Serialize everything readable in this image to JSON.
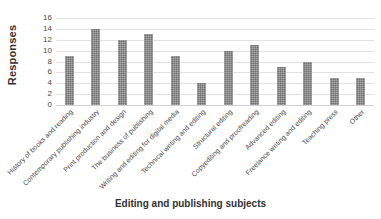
{
  "chart_data": {
    "type": "bar",
    "title": "",
    "xlabel": "Editing and publishing subjects",
    "ylabel": "Responses",
    "ylim": [
      0,
      16
    ],
    "ytick_step": 2,
    "yticks": [
      16,
      14,
      12,
      10,
      8,
      6,
      4,
      2,
      0
    ],
    "grid": true,
    "legend": false,
    "bar_color": "#707070",
    "categories": [
      "History of books and reading",
      "Contemporary publishing industry",
      "Print production and design",
      "The business of publishing",
      "Writing and editing for digital media",
      "Technical writing and editing",
      "Structural editing",
      "Copyediting and proofreading",
      "Advanced editing",
      "Freelance writing and editing",
      "Teaching press",
      "Other"
    ],
    "values": [
      9,
      14,
      12,
      13,
      9,
      4,
      10,
      11,
      7,
      8,
      5,
      5
    ]
  }
}
